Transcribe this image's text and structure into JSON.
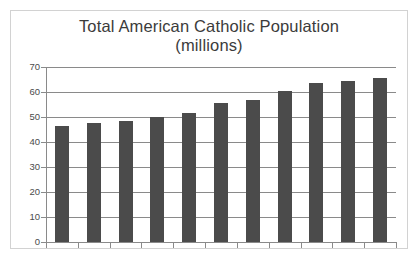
{
  "chart_data": {
    "type": "bar",
    "title": "Total American Catholic Population\n(millions)",
    "title_line1": "Total American Catholic Population",
    "title_line2": "(millions)",
    "xlabel": "",
    "ylabel": "",
    "ylim": [
      0,
      70
    ],
    "ytick_step": 10,
    "ytick_labels": [
      "0",
      "10",
      "20",
      "30",
      "40",
      "50",
      "60",
      "70"
    ],
    "ytick_values": [
      0,
      10,
      20,
      30,
      40,
      50,
      60,
      70
    ],
    "xtick_labels": [
      "",
      "",
      "",
      "",
      "",
      "",
      "",
      "",
      "",
      "",
      ""
    ],
    "grid": true,
    "grid_axis": "y",
    "legend": false,
    "bar_color": "#4b4b4b",
    "gridline_color": "#8a8a8a",
    "border_color": "#d2d2d2",
    "background_color": "#ffffff",
    "title_color": "#3b3b3b",
    "categories": [
      "1",
      "2",
      "3",
      "4",
      "5",
      "6",
      "7",
      "8",
      "9",
      "10",
      "11"
    ],
    "values": [
      46.5,
      47.5,
      48.5,
      50,
      51.5,
      55.5,
      57,
      60.5,
      63.5,
      64.5,
      65.5
    ]
  }
}
